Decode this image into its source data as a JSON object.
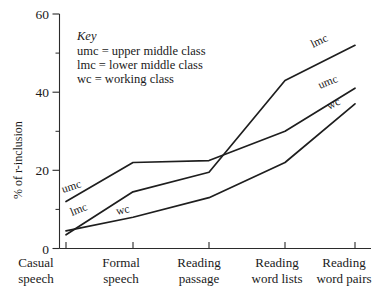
{
  "chart_data": {
    "type": "line",
    "title": "",
    "xlabel": "",
    "ylabel": "% of r-inclusion",
    "ylim": [
      0,
      60
    ],
    "yticks": [
      0,
      20,
      40,
      60
    ],
    "yticks_minor": [
      10,
      30,
      50
    ],
    "grid": false,
    "legend_position": "inline-labels",
    "categories": [
      "Casual speech",
      "Formal speech",
      "Reading passage",
      "Reading word lists",
      "Reading word pairs"
    ],
    "series": [
      {
        "name": "umc",
        "values": [
          12,
          22,
          22.5,
          30,
          41
        ]
      },
      {
        "name": "lmc",
        "values": [
          3.5,
          14.5,
          19.5,
          43,
          52
        ]
      },
      {
        "name": "wc",
        "values": [
          4.5,
          8,
          13,
          22,
          37
        ]
      }
    ]
  },
  "axis": {
    "y_label": "% of r-inclusion",
    "y_ticks": [
      "0",
      "20",
      "40",
      "60"
    ],
    "x_ticks": [
      {
        "line1": "Casual",
        "line2": "speech"
      },
      {
        "line1": "Formal",
        "line2": "speech"
      },
      {
        "line1": "Reading",
        "line2": "passage"
      },
      {
        "line1": "Reading",
        "line2": "word lists"
      },
      {
        "line1": "Reading",
        "line2": "word pairs"
      }
    ]
  },
  "key": {
    "title": "Key",
    "entries": [
      "umc = upper middle class",
      "lmc = lower middle class",
      "wc = working class"
    ]
  },
  "series_labels": {
    "umc_left": "umc",
    "lmc_left": "lmc",
    "wc_left": "wc",
    "lmc_right": "lmc",
    "umc_right": "umc",
    "wc_right": "wc"
  },
  "colors": {
    "line": "#1e1e1e",
    "axis": "#2b2b2b",
    "text": "#1a1a1a",
    "background": "#ffffff"
  }
}
